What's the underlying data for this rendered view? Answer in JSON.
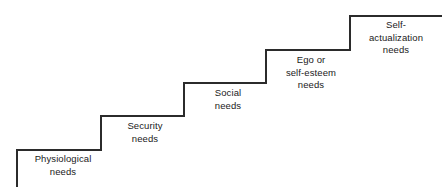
{
  "diagram": {
    "name": "maslow-hierarchy-of-needs-staircase",
    "background_color": "#ffffff",
    "line_color": "#2b2b2b",
    "text_color": "#1a1a1a",
    "line_width": 1.3,
    "steps": [
      {
        "id": "physiological",
        "label": "Physiological\nneeds",
        "level": 1,
        "riser_x": 17,
        "riser_y_top": 150,
        "riser_y_bottom": 186,
        "tread_y": 150,
        "tread_x_start": 17,
        "tread_x_end": 101
      },
      {
        "id": "security",
        "label": "Security\nneeds",
        "level": 2,
        "riser_x": 101,
        "riser_y_top": 116,
        "riser_y_bottom": 150,
        "tread_y": 116,
        "tread_x_start": 101,
        "tread_x_end": 184
      },
      {
        "id": "social",
        "label": "Social\nneeds",
        "level": 3,
        "riser_x": 184,
        "riser_y_top": 83,
        "riser_y_bottom": 116,
        "tread_y": 83,
        "tread_x_start": 184,
        "tread_x_end": 266
      },
      {
        "id": "ego-self-esteem",
        "label": "Ego or\nself-esteem\nneeds",
        "level": 4,
        "riser_x": 266,
        "riser_y_top": 50,
        "riser_y_bottom": 83,
        "tread_y": 50,
        "tread_x_start": 266,
        "tread_x_end": 350
      },
      {
        "id": "self-actualization",
        "label": "Self-\nactualization\nneeds",
        "level": 5,
        "riser_x": 350,
        "riser_y_top": 16,
        "riser_y_bottom": 50,
        "tread_y": 16,
        "tread_x_start": 350,
        "tread_x_end": 441
      }
    ],
    "path": "M 17 186 L 17 150 L 101 150 L 101 116 L 184 116 L 184 83 L 266 83 L 266 50 L 350 50 L 350 16 L 441 16"
  }
}
